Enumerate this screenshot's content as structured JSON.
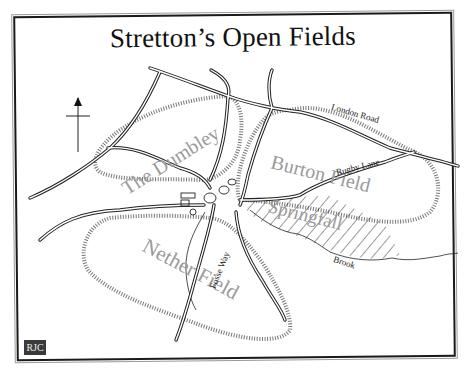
{
  "map": {
    "title": "Stretton’s Open Fields",
    "north_arrow": "north-arrow",
    "credit_badge": "RJC",
    "fields": [
      {
        "name": "The Dumbley"
      },
      {
        "name": "Burton Field"
      },
      {
        "name": "Springfall"
      },
      {
        "name": "Nether Field"
      }
    ],
    "roads": [
      {
        "name": "London Road"
      },
      {
        "name": "Rugby Lane"
      },
      {
        "name": "Fosse Way"
      }
    ],
    "water": [
      {
        "name": "Brook"
      }
    ],
    "colors": {
      "ink": "#1a1a1a",
      "field_label": "#9a9a9a",
      "background": "#ffffff",
      "badge": "#3a3a3a"
    }
  }
}
